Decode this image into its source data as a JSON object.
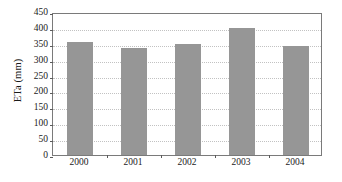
{
  "chart_data": {
    "type": "bar",
    "title": "",
    "subtitle": "",
    "xlabel": "",
    "ylabel": "ETa (mm)",
    "categories": [
      "2000",
      "2001",
      "2002",
      "2003",
      "2004"
    ],
    "values": [
      355,
      337,
      348,
      400,
      343
    ],
    "series": [
      {
        "name": "ETa",
        "values": [
          355,
          337,
          348,
          400,
          343
        ]
      }
    ],
    "ylim": [
      0,
      450
    ],
    "yticks": [
      0,
      50,
      100,
      150,
      200,
      250,
      300,
      350,
      400,
      450
    ],
    "ytick_labels": [
      "0",
      "50",
      "100",
      "150",
      "200",
      "250",
      "300",
      "350",
      "400",
      "450"
    ],
    "grid": true,
    "grid_axis": "y",
    "legend": false,
    "legend_position": "none",
    "bar_color": "#969696",
    "axis_color": "#7a7a7a",
    "grid_color": "#c2c2c2",
    "text_color": "#1a1a1a",
    "background_color": "#ffffff",
    "annotations": []
  }
}
